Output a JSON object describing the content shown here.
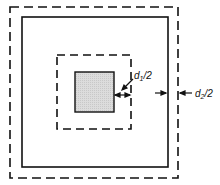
{
  "diagram": {
    "labels": {
      "d1_main": "d",
      "d1_sub": "1",
      "d1_tail": "/2",
      "d2_main": "d",
      "d2_sub": "2",
      "d2_tail": "/2"
    },
    "colors": {
      "stroke": "#111111",
      "fill_core": "#d8d8d8",
      "background": "#ffffff"
    }
  }
}
